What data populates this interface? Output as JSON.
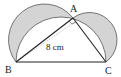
{
  "diagram": {
    "points": {
      "A": {
        "label": "A",
        "x": 73,
        "y": 18
      },
      "B": {
        "label": "B",
        "x": 16,
        "y": 62
      },
      "C": {
        "label": "C",
        "x": 106,
        "y": 62
      }
    },
    "measurement": "8 cm",
    "colors": {
      "shade": "#d4d4d4",
      "stroke": "#333333",
      "arc": "#555555",
      "dotted": "#999999"
    }
  }
}
